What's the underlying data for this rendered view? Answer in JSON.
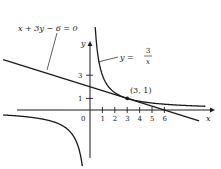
{
  "chart_data": {
    "type": "line",
    "title": "",
    "xlabel": "x",
    "ylabel": "y",
    "origin_label": "0",
    "x_ticks": [
      1,
      2,
      3,
      4,
      5,
      6
    ],
    "x_tick_labels": [
      "1",
      "2",
      "3",
      "4",
      "5",
      "6"
    ],
    "y_ticks": [
      1,
      3
    ],
    "y_tick_labels": [
      "1",
      "3"
    ],
    "xlim": [
      -7,
      9.5
    ],
    "ylim": [
      -5,
      7.5
    ],
    "series": [
      {
        "name": "line",
        "label": "x + 3y − 6 = 0",
        "equation": "y = (6 - x) / 3",
        "x_range": [
          -7,
          8.8
        ]
      },
      {
        "name": "hyperbola",
        "label_prefix": "y = ",
        "label_num": "3",
        "label_den": "x",
        "equation": "y = 3 / x",
        "branches": [
          [
            0.42,
            9.3
          ],
          [
            -7,
            -0.62
          ]
        ]
      }
    ],
    "points": [
      {
        "x": 3,
        "y": 1,
        "label": "(3, 1)"
      }
    ]
  }
}
